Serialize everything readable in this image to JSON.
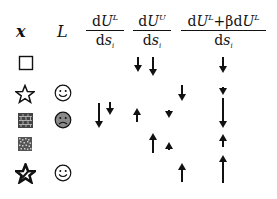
{
  "header": {
    "x_label": "x",
    "L_label": "L",
    "col1": {
      "num_d": "d",
      "num_U": "U",
      "num_sup": "L",
      "den_d": "d",
      "den_s": "s",
      "den_sub": "i"
    },
    "col2": {
      "num_d": "d",
      "num_U": "U",
      "num_sup": "U",
      "den_d": "d",
      "den_s": "s",
      "den_sub": "i"
    },
    "col3": {
      "num_d1": "d",
      "num_U1": "U",
      "num_sup1": "L",
      "plus_beta": "+βd",
      "num_U2": "U",
      "num_sup2": "L",
      "den_d": "d",
      "den_s": "s",
      "den_sub": "i"
    }
  },
  "rows": [
    {
      "x_symbol": "square-outline",
      "L_face": null
    },
    {
      "x_symbol": "star-outline",
      "L_face": "happy"
    },
    {
      "x_symbol": "brick-square",
      "L_face": "sad-gray"
    },
    {
      "x_symbol": "dotted-square",
      "L_face": null
    },
    {
      "x_symbol": "star-slashed",
      "L_face": "happy"
    }
  ],
  "arrows": [
    {
      "col": "dUU_dsi",
      "row": 1,
      "dir": "down",
      "x": 138,
      "y1": 57,
      "y2": 72
    },
    {
      "col": "dUU_dsi",
      "row": 1,
      "dir": "down",
      "x": 153,
      "y1": 57,
      "y2": 76
    },
    {
      "col": "combined",
      "row": 1,
      "dir": "down",
      "x": 223,
      "y1": 57,
      "y2": 73
    },
    {
      "col": "dUU_dsi",
      "row": 2,
      "dir": "down",
      "x": 182,
      "y1": 85,
      "y2": 101
    },
    {
      "col": "combined",
      "row": 2,
      "dir": "down",
      "x": 223,
      "y1": 87,
      "y2": 95
    },
    {
      "col": "dUL_dsi",
      "row": 3,
      "dir": "down",
      "x": 99,
      "y1": 103,
      "y2": 128
    },
    {
      "col": "dUL_dsi",
      "row": 3,
      "dir": "down",
      "x": 110,
      "y1": 102,
      "y2": 115
    },
    {
      "col": "dUU_dsi",
      "row": 3,
      "dir": "up",
      "x": 137,
      "y1": 108,
      "y2": 122
    },
    {
      "col": "dUU_dsi",
      "row": 3,
      "dir": "down",
      "x": 169,
      "y1": 110,
      "y2": 118
    },
    {
      "col": "combined",
      "row": 3,
      "dir": "down",
      "x": 223,
      "y1": 98,
      "y2": 128
    },
    {
      "col": "dUU_dsi",
      "row": 4,
      "dir": "up",
      "x": 153,
      "y1": 133,
      "y2": 153
    },
    {
      "col": "dUU_dsi",
      "row": 4,
      "dir": "up",
      "x": 169,
      "y1": 142,
      "y2": 150
    },
    {
      "col": "combined",
      "row": 4,
      "dir": "up",
      "x": 223,
      "y1": 134,
      "y2": 147
    },
    {
      "col": "dUU_dsi",
      "row": 5,
      "dir": "up",
      "x": 182,
      "y1": 163,
      "y2": 182
    },
    {
      "col": "combined",
      "row": 5,
      "dir": "up",
      "x": 223,
      "y1": 155,
      "y2": 183
    }
  ],
  "colors": {
    "ink": "#111111",
    "sad_face_fill": "#8a8a8a",
    "background": "#ffffff"
  }
}
